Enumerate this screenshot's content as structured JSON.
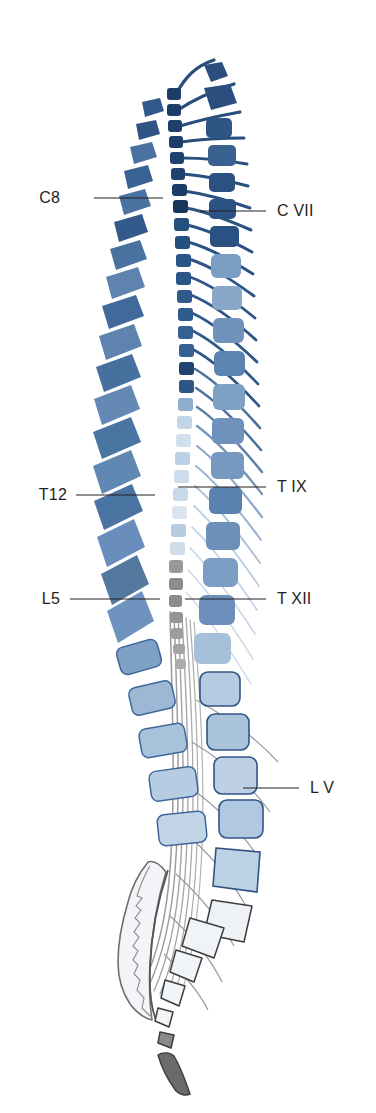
{
  "figure": {
    "background_color": "#ffffff",
    "width": 376,
    "height": 1113
  },
  "labels": [
    {
      "id": "c8",
      "text": "C8",
      "side": "left",
      "text_x": 60,
      "text_y": 203,
      "line_x1": 94,
      "line_y1": 198,
      "line_x2": 163,
      "line_y2": 198,
      "target": "spinal-cord-segment-C8"
    },
    {
      "id": "cvii",
      "text": "C VII",
      "side": "right",
      "text_x": 277,
      "text_y": 216,
      "line_x1": 266,
      "line_y1": 211,
      "line_x2": 200,
      "line_y2": 211,
      "target": "vertebral-body-C7"
    },
    {
      "id": "t12",
      "text": "T12",
      "side": "left",
      "text_x": 67,
      "text_y": 500,
      "line_x1": 76,
      "line_y1": 495,
      "line_x2": 155,
      "line_y2": 495,
      "target": "spinal-cord-segment-T12"
    },
    {
      "id": "tix",
      "text": "T IX",
      "side": "right",
      "text_x": 277,
      "text_y": 492,
      "line_x1": 266,
      "line_y1": 487,
      "line_x2": 178,
      "line_y2": 487,
      "target": "vertebral-body-T9"
    },
    {
      "id": "l5",
      "text": "L5",
      "side": "left",
      "text_x": 60,
      "text_y": 604,
      "line_x1": 70,
      "line_y1": 599,
      "line_x2": 160,
      "line_y2": 599,
      "target": "spinal-cord-segment-L5"
    },
    {
      "id": "txii",
      "text": "T XII",
      "side": "right",
      "text_x": 277,
      "text_y": 604,
      "line_x1": 266,
      "line_y1": 599,
      "line_x2": 185,
      "line_y2": 599,
      "target": "vertebral-body-T12"
    },
    {
      "id": "lv",
      "text": "L V",
      "side": "right",
      "text_x": 310,
      "text_y": 793,
      "line_x1": 299,
      "line_y1": 788,
      "line_x2": 243,
      "line_y2": 788,
      "target": "vertebral-body-L5"
    }
  ],
  "palette": {
    "ink_dark": "#1d3d66",
    "ink_mid": "#3d6795",
    "vertebra_dark": "#2b4f7e",
    "vertebra_mid": "#5b83ae",
    "vertebra_light": "#9fbbd6",
    "vertebra_pale": "#c3d6e8",
    "vertebra_faint": "#e4edf5",
    "cord_dark": "#1b3c66",
    "cord_light": "#cfdeed",
    "cord_faint": "#eaf1f8",
    "gray_mid": "#8c8c8c",
    "gray_dark": "#5f5f5f",
    "gray_light": "#d9d9d9",
    "sacrum_fill": "#f2f4f7",
    "outline_gray": "#6e6e6e",
    "label_text": "#231f20"
  },
  "structures": {
    "spinous_processes": {
      "name": "spinous-processes",
      "count": 24,
      "description": "Left column of angled vertebral spinous processes, blue"
    },
    "cord_segments": {
      "name": "spinal-cord-segments",
      "count": 31,
      "description": "Central column of small squares, dark navy at top fading to pale blue then gray"
    },
    "vertebral_bodies": {
      "name": "vertebral-bodies",
      "count": 24,
      "description": "Right column of rounded squares, dark navy at top fading to pale blue"
    },
    "nerve_roots": {
      "name": "nerve-roots",
      "count": 31,
      "description": "Curved lines radiating right from cord segments"
    },
    "cauda_equina": {
      "name": "cauda-equina",
      "description": "Bundle of fine descending gray fibers below the conus medullaris"
    },
    "sacrum": {
      "name": "sacrum",
      "description": "Pale scalloped triangular bone at bottom left"
    },
    "coccyx": {
      "name": "coccyx",
      "description": "Small dark gray tapered bone at bottom"
    }
  }
}
